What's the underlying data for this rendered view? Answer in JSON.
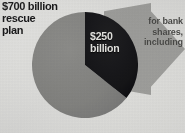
{
  "headline": {
    "lines": [
      "$700 billion",
      "rescue",
      "plan"
    ]
  },
  "callout": {
    "lines": [
      "for bank",
      "shares,",
      "including"
    ]
  },
  "slice_labels": {
    "dark": [
      "$250",
      "billion"
    ]
  },
  "colors": {
    "background": "#ececeb",
    "slice_gray": "#8d8d8b",
    "slice_dark": "#17171a",
    "arrow_gray": "#a8a8a6",
    "headline_text": "#18181a",
    "dark_slice_text": "#f4f4f2",
    "arrow_text": "#4b4b49"
  },
  "chart_data": {
    "type": "pie",
    "title": "$700 billion rescue plan",
    "unit": "billions of US dollars",
    "total": 700,
    "categories": [
      "Remainder of rescue plan",
      "$250 billion for bank shares, including"
    ],
    "values": [
      450,
      250
    ],
    "labels": [
      "",
      "$250 billion"
    ],
    "slice_colors": [
      "#8d8d8b",
      "#17171a"
    ],
    "start_angle_deg": 0,
    "direction": "clockwise",
    "legend": "none",
    "grid": false,
    "annotations": [
      {
        "text": "$700 billion rescue plan",
        "position": "top-left"
      },
      {
        "text": "for bank shares, including",
        "position": "right-arrow-banner"
      },
      {
        "text": "$250 billion",
        "position": "inside-dark-slice"
      }
    ]
  }
}
